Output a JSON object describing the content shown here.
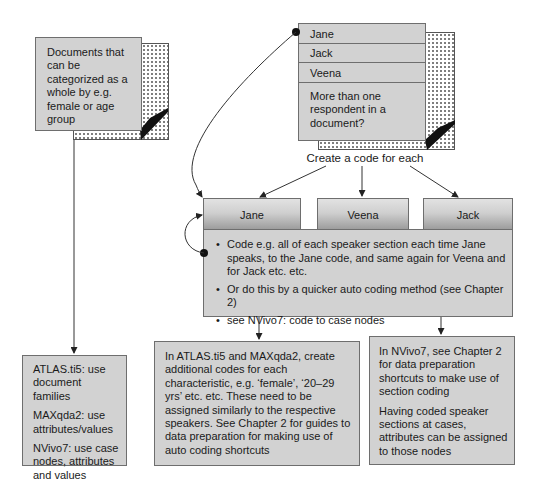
{
  "left_document": {
    "text": "Documents that can be categorized as a whole by e.g. female or age group"
  },
  "multi_respondent_document": {
    "rows": [
      "Jane",
      "Jack",
      "Veena"
    ],
    "question": "More than one respondent in a document?"
  },
  "create_code_label": "Create a code for each",
  "speaker_codes": {
    "tabs": [
      "Jane",
      "Veena",
      "Jack"
    ],
    "bullets": [
      "Code e.g. all of each speaker section each time Jane speaks, to the Jane code, and same again for Veena and for Jack etc. etc.",
      "Or do this by a quicker auto coding method (see Chapter 2)",
      "see NVivo7: code to case nodes"
    ]
  },
  "software_left_box": {
    "paragraphs": [
      "ATLAS.ti5: use document families",
      "MAXqda2: use attributes/values",
      "NVivo7: use case nodes, attributes and values"
    ]
  },
  "atlas_maxqda_box": {
    "text": "In ATLAS.ti5 and MAXqda2, create additional codes for each characteristic, e.g. ‘female’, ‘20–29 yrs’ etc. etc. These need to be assigned similarly to the respective speakers. See Chapter 2 for guides to data preparation for making use of auto coding shortcuts"
  },
  "nvivo_box": {
    "paragraphs": [
      "In NVivo7, see Chapter 2 for data preparation shortcuts to make use of section coding",
      "Having coded speaker sections at cases, attributes can be assigned to those nodes"
    ]
  },
  "colors": {
    "box_fill": "#d2d2d2",
    "border": "#6e6e6e",
    "line": "#333333",
    "background": "#ffffff"
  }
}
